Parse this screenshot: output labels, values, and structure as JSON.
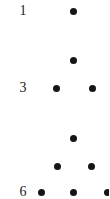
{
  "figure": {
    "type": "dot-diagram",
    "width": 109,
    "height": 199,
    "background_color": "#ffffff",
    "dot_color": "#151515",
    "label_color": "#1a1a1a",
    "dot_diameter": 7,
    "rows": [
      {
        "index": 1,
        "label": "1",
        "label_x": 23,
        "label_y": 11,
        "y": 11,
        "dot_count": 1,
        "dots_x": [
          73
        ]
      },
      {
        "index": 2,
        "label": "",
        "label_x": 23,
        "label_y": 60,
        "y": 60,
        "dot_count": 1,
        "dots_x": [
          73
        ]
      },
      {
        "index": 3,
        "label": "3",
        "label_x": 23,
        "label_y": 88,
        "y": 88,
        "dot_count": 2,
        "dots_x": [
          56,
          92
        ]
      },
      {
        "index": 4,
        "label": "",
        "label_x": 23,
        "label_y": 138,
        "y": 138,
        "dot_count": 1,
        "dots_x": [
          73
        ]
      },
      {
        "index": 5,
        "label": "",
        "label_x": 23,
        "label_y": 166,
        "y": 166,
        "dot_count": 2,
        "dots_x": [
          57,
          91
        ]
      },
      {
        "index": 6,
        "label": "6",
        "label_x": 23,
        "label_y": 192,
        "y": 192,
        "dot_count": 3,
        "dots_x": [
          41,
          73,
          107
        ]
      }
    ]
  }
}
